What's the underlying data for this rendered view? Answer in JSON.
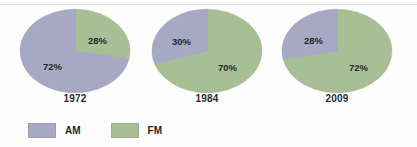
{
  "chart_data": {
    "type": "pie",
    "title": "",
    "legend_position": "bottom-left",
    "series": [
      {
        "name": "AM",
        "color": "#a7a9c4",
        "values": [
          72,
          30,
          28
        ]
      },
      {
        "name": "FM",
        "color": "#a8bf96",
        "values": [
          28,
          70,
          72
        ]
      }
    ],
    "categories": [
      "1972",
      "1984",
      "2009"
    ],
    "charts": [
      {
        "year": "1972",
        "slices": [
          {
            "label": "AM",
            "value": 72,
            "display": "72%",
            "color": "#a7a9c4"
          },
          {
            "label": "FM",
            "value": 28,
            "display": "28%",
            "color": "#a8bf96"
          }
        ]
      },
      {
        "year": "1984",
        "slices": [
          {
            "label": "AM",
            "value": 30,
            "display": "30%",
            "color": "#a7a9c4"
          },
          {
            "label": "FM",
            "value": 70,
            "display": "70%",
            "color": "#a8bf96"
          }
        ]
      },
      {
        "year": "2009",
        "slices": [
          {
            "label": "AM",
            "value": 28,
            "display": "28%",
            "color": "#a7a9c4"
          },
          {
            "label": "FM",
            "value": 72,
            "display": "72%",
            "color": "#a8bf96"
          }
        ]
      }
    ]
  },
  "legend": {
    "items": [
      {
        "label": "AM",
        "color": "#a7a9c4"
      },
      {
        "label": "FM",
        "color": "#a8bf96"
      }
    ]
  },
  "labels": {
    "chart0": {
      "year": "1972",
      "am": "72%",
      "fm": "28%"
    },
    "chart1": {
      "year": "1984",
      "am": "30%",
      "fm": "70%"
    },
    "chart2": {
      "year": "2009",
      "am": "28%",
      "fm": "72%"
    }
  }
}
